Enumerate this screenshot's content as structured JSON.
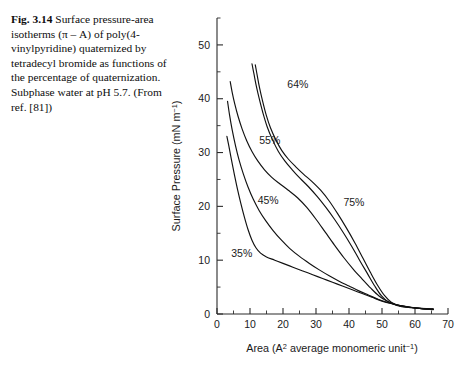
{
  "caption": {
    "fig_label": "Fig. 3.14",
    "text": " Surface pressure-area isotherms (π – A) of poly(4-vinylpyridine) quaternized by tetradecyl bromide as functions of the percentage of quaternization. Subphase water at pH 5.7. (From ref. [81])"
  },
  "chart_data": {
    "type": "line",
    "title": "",
    "xlabel": "Area (A² average monomeric unit⁻¹)",
    "ylabel": "Surface Pressure (mN m⁻¹)",
    "xlabel_parts": {
      "main": "Area (A",
      "sup1": "2",
      "mid": " average monomeric unit",
      "sup2": "−1",
      "end": ")"
    },
    "ylabel_parts": {
      "main": "Surface Pressure (mN m",
      "sup": "−1",
      "end": ")"
    },
    "xlim": [
      0,
      70
    ],
    "ylim": [
      0,
      55
    ],
    "x_ticks": [
      0,
      10,
      20,
      30,
      40,
      50,
      60,
      70
    ],
    "x_tick_labels": [
      "0",
      "10",
      "20",
      "30",
      "40",
      "50",
      "60",
      "70"
    ],
    "x_minor_step": 5,
    "y_ticks": [
      0,
      10,
      20,
      30,
      40,
      50
    ],
    "y_tick_labels": [
      "0",
      "10",
      "20",
      "30",
      "40",
      "50"
    ],
    "y_minor_step": 5,
    "grid": false,
    "legend": "inline-annotations",
    "series": [
      {
        "name": "35%",
        "label": "35%",
        "label_xy": [
          7.5,
          10.5
        ],
        "points": [
          [
            3.0,
            33.0
          ],
          [
            3.6,
            31.2
          ],
          [
            4.4,
            28.6
          ],
          [
            5.3,
            25.8
          ],
          [
            6.2,
            23.2
          ],
          [
            7.2,
            20.6
          ],
          [
            8.3,
            18.0
          ],
          [
            9.4,
            15.7
          ],
          [
            10.6,
            13.7
          ],
          [
            11.8,
            12.3
          ],
          [
            13.2,
            11.3
          ],
          [
            15.0,
            10.6
          ],
          [
            17.5,
            10.0
          ],
          [
            20.0,
            9.4
          ],
          [
            23.0,
            8.7
          ],
          [
            26.0,
            8.0
          ],
          [
            29.0,
            7.3
          ],
          [
            32.0,
            6.6
          ],
          [
            35.0,
            5.9
          ],
          [
            38.0,
            5.2
          ],
          [
            41.0,
            4.5
          ],
          [
            44.0,
            3.8
          ],
          [
            47.0,
            3.1
          ],
          [
            50.0,
            2.4
          ],
          [
            53.0,
            1.9
          ],
          [
            56.0,
            1.5
          ],
          [
            59.0,
            1.2
          ],
          [
            62.0,
            1.0
          ],
          [
            65.5,
            0.8
          ]
        ]
      },
      {
        "name": "45%",
        "label": "45%",
        "label_xy": [
          15.5,
          20.5
        ],
        "points": [
          [
            3.2,
            39.5
          ],
          [
            3.8,
            37.0
          ],
          [
            4.6,
            34.2
          ],
          [
            5.6,
            31.3
          ],
          [
            6.7,
            28.6
          ],
          [
            8.0,
            26.0
          ],
          [
            9.4,
            23.6
          ],
          [
            11.0,
            21.3
          ],
          [
            12.8,
            19.2
          ],
          [
            14.8,
            17.3
          ],
          [
            17.0,
            15.5
          ],
          [
            19.4,
            13.8
          ],
          [
            22.0,
            12.2
          ],
          [
            25.0,
            10.7
          ],
          [
            28.0,
            9.4
          ],
          [
            31.0,
            8.2
          ],
          [
            34.0,
            7.1
          ],
          [
            37.0,
            6.1
          ],
          [
            40.0,
            5.2
          ],
          [
            43.0,
            4.3
          ],
          [
            46.0,
            3.5
          ],
          [
            49.0,
            2.7
          ],
          [
            52.0,
            2.1
          ],
          [
            55.0,
            1.6
          ],
          [
            58.0,
            1.3
          ],
          [
            61.0,
            1.1
          ],
          [
            65.5,
            0.9
          ]
        ]
      },
      {
        "name": "55%",
        "label": "55%",
        "label_xy": [
          16.0,
          31.5
        ],
        "points": [
          [
            4.0,
            43.2
          ],
          [
            4.6,
            41.2
          ],
          [
            5.4,
            39.0
          ],
          [
            6.4,
            36.7
          ],
          [
            7.6,
            34.4
          ],
          [
            9.0,
            32.2
          ],
          [
            10.6,
            30.2
          ],
          [
            12.4,
            28.4
          ],
          [
            14.4,
            26.8
          ],
          [
            16.6,
            25.4
          ],
          [
            19.0,
            24.2
          ],
          [
            21.6,
            23.0
          ],
          [
            24.4,
            21.6
          ],
          [
            27.2,
            19.8
          ],
          [
            30.0,
            17.6
          ],
          [
            32.8,
            15.2
          ],
          [
            35.6,
            12.8
          ],
          [
            38.4,
            10.5
          ],
          [
            41.2,
            8.4
          ],
          [
            44.0,
            6.5
          ],
          [
            46.6,
            4.8
          ],
          [
            49.0,
            3.4
          ],
          [
            51.5,
            2.4
          ],
          [
            54.5,
            1.7
          ],
          [
            58.0,
            1.3
          ],
          [
            62.0,
            1.0
          ],
          [
            65.5,
            0.9
          ]
        ]
      },
      {
        "name": "64%",
        "label": "64%",
        "label_xy": [
          24.5,
          42.0
        ],
        "points": [
          [
            10.6,
            46.5
          ],
          [
            11.2,
            44.6
          ],
          [
            11.9,
            42.4
          ],
          [
            12.8,
            40.0
          ],
          [
            13.9,
            37.4
          ],
          [
            15.2,
            34.8
          ],
          [
            16.8,
            32.4
          ],
          [
            18.6,
            30.2
          ],
          [
            20.6,
            28.4
          ],
          [
            22.8,
            26.8
          ],
          [
            25.2,
            25.2
          ],
          [
            27.8,
            23.6
          ],
          [
            30.4,
            21.8
          ],
          [
            33.0,
            19.8
          ],
          [
            35.6,
            17.6
          ],
          [
            38.2,
            15.2
          ],
          [
            40.8,
            12.6
          ],
          [
            43.2,
            10.0
          ],
          [
            45.6,
            7.5
          ],
          [
            47.8,
            5.2
          ],
          [
            49.8,
            3.4
          ],
          [
            51.8,
            2.3
          ],
          [
            54.5,
            1.6
          ],
          [
            58.0,
            1.2
          ],
          [
            62.0,
            1.0
          ],
          [
            65.5,
            0.9
          ]
        ]
      },
      {
        "name": "75%",
        "label": "75%",
        "label_xy": [
          41.5,
          20.0
        ],
        "points": [
          [
            11.6,
            46.3
          ],
          [
            12.2,
            44.3
          ],
          [
            12.9,
            42.0
          ],
          [
            13.8,
            39.6
          ],
          [
            14.9,
            37.0
          ],
          [
            16.2,
            34.6
          ],
          [
            17.8,
            32.4
          ],
          [
            19.6,
            30.4
          ],
          [
            21.6,
            28.8
          ],
          [
            23.8,
            27.4
          ],
          [
            26.2,
            26.0
          ],
          [
            28.8,
            24.6
          ],
          [
            31.4,
            23.0
          ],
          [
            34.0,
            21.0
          ],
          [
            36.6,
            18.6
          ],
          [
            39.2,
            16.0
          ],
          [
            41.8,
            13.2
          ],
          [
            44.2,
            10.4
          ],
          [
            46.6,
            7.6
          ],
          [
            48.8,
            5.2
          ],
          [
            50.8,
            3.4
          ],
          [
            52.8,
            2.2
          ],
          [
            55.5,
            1.5
          ],
          [
            59.0,
            1.2
          ],
          [
            62.5,
            1.0
          ],
          [
            65.5,
            0.9
          ]
        ]
      }
    ]
  }
}
